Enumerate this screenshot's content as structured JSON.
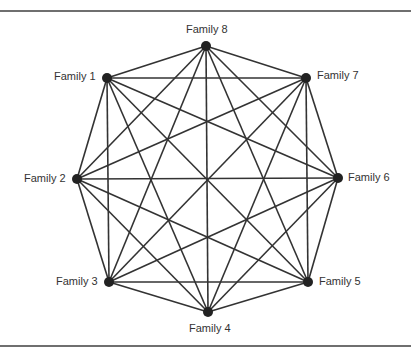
{
  "diagram": {
    "type": "complete-graph",
    "edge_color": "#333333",
    "node_color": "#222222",
    "nodes": [
      {
        "id": "f1",
        "label": "Family 1",
        "x": 107,
        "y": 78
      },
      {
        "id": "f2",
        "label": "Family 2",
        "x": 77,
        "y": 179
      },
      {
        "id": "f3",
        "label": "Family 3",
        "x": 109,
        "y": 282
      },
      {
        "id": "f4",
        "label": "Family 4",
        "x": 208,
        "y": 312
      },
      {
        "id": "f5",
        "label": "Family 5",
        "x": 308,
        "y": 282
      },
      {
        "id": "f6",
        "label": "Family 6",
        "x": 338,
        "y": 178
      },
      {
        "id": "f7",
        "label": "Family 7",
        "x": 306,
        "y": 78
      },
      {
        "id": "f8",
        "label": "Family 8",
        "x": 206,
        "y": 46
      }
    ]
  }
}
